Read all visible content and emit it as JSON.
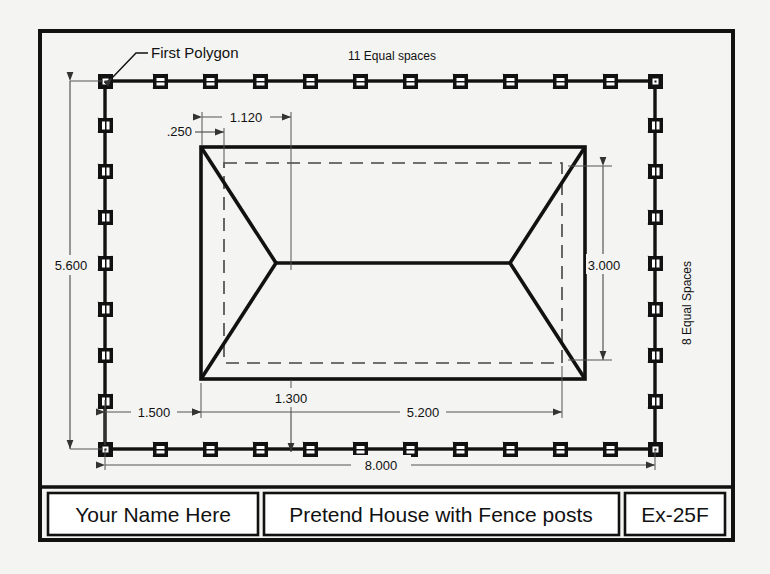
{
  "drawing": {
    "type": "engineering-plan",
    "units": "decimal",
    "annotations": {
      "first_polygon": "First Polygon",
      "top_spaces": "11 Equal spaces",
      "side_spaces": "8 Equal Spaces"
    },
    "dimensions": {
      "left_height": "5.600",
      "bottom_overall": "8.000",
      "bottom_left_offset": "1.500",
      "bottom_inner_offset": "1.300",
      "bottom_house_width": "5.200",
      "right_house_height": "3.000",
      "top_small_offset": ".250",
      "top_inner_offset": "1.120"
    },
    "fence": {
      "top_post_count": 12,
      "bottom_post_count": 12,
      "left_post_count": 9,
      "right_post_count": 9,
      "top_spaces": 11,
      "side_spaces": 8
    }
  },
  "title_block": {
    "name_field": "Your Name Here",
    "description_field": "Pretend House with Fence posts",
    "number_field": "Ex-25F"
  },
  "colors": {
    "ink": "#111111",
    "paper": "#f4f4f2",
    "thin_line": "#555555",
    "cross_mark": "#bbbbbb",
    "block_fill": "#ffffff"
  }
}
